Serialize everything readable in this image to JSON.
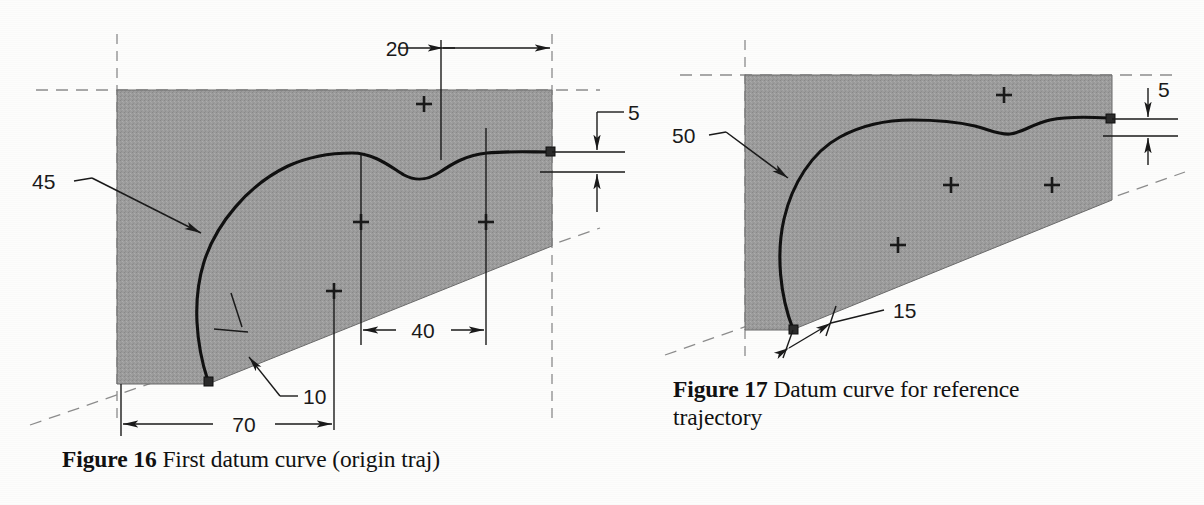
{
  "page": {
    "background_color": "#fdfdfc",
    "ink_color": "#1a1a1a",
    "fill_color": "#9a9a9a"
  },
  "figures": [
    {
      "id": "figure-16",
      "caption_label": "Figure 16",
      "caption_text": " First datum curve (origin traj)",
      "dimensions": [
        {
          "name": "dim-20",
          "value": "20"
        },
        {
          "name": "dim-5",
          "value": "5"
        },
        {
          "name": "dim-45",
          "value": "45"
        },
        {
          "name": "dim-40",
          "value": "40"
        },
        {
          "name": "dim-10",
          "value": "10"
        },
        {
          "name": "dim-70",
          "value": "70"
        }
      ],
      "shape": {
        "type": "shaded-polygon-with-datum-curve",
        "fill": "#9a9a9a"
      },
      "marker_count": 4
    },
    {
      "id": "figure-17",
      "caption_label": "Figure 17",
      "caption_text": " Datum curve for reference trajectory",
      "dimensions": [
        {
          "name": "dim-50",
          "value": "50"
        },
        {
          "name": "dim-5",
          "value": "5"
        },
        {
          "name": "dim-15",
          "value": "15"
        }
      ],
      "shape": {
        "type": "shaded-polygon-with-datum-curve",
        "fill": "#9a9a9a"
      },
      "marker_count": 4
    }
  ],
  "labels": {
    "f16_20": "20",
    "f16_5": "5",
    "f16_45": "45",
    "f16_40": "40",
    "f16_10": "10",
    "f16_70": "70",
    "f17_50": "50",
    "f17_5": "5",
    "f17_15": "15",
    "caption16_bold": "Figure 16",
    "caption16_rest": " First datum curve (origin traj)",
    "caption17_bold": "Figure 17",
    "caption17_rest": " Datum curve for reference trajectory"
  }
}
